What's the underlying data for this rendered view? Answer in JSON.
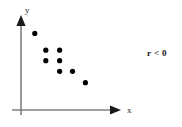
{
  "chart_data": {
    "type": "scatter",
    "title": "",
    "subtitle": "",
    "xlabel": "x",
    "ylabel": "y",
    "xlim": [
      0,
      10
    ],
    "ylim": [
      0,
      10
    ],
    "grid": false,
    "legend": null,
    "annotations": [
      {
        "name": "correlation-annotation",
        "text": "r < 0",
        "x": 9.3,
        "y": 8.0
      }
    ],
    "series": [
      {
        "name": "scatter-series",
        "marker": "filled-circle",
        "color": "#000000",
        "points": [
          {
            "x": 1.5,
            "y": 8.7
          },
          {
            "x": 2.7,
            "y": 6.8
          },
          {
            "x": 4.2,
            "y": 6.8
          },
          {
            "x": 2.7,
            "y": 5.6
          },
          {
            "x": 4.2,
            "y": 5.6
          },
          {
            "x": 4.2,
            "y": 4.4
          },
          {
            "x": 5.6,
            "y": 4.4
          },
          {
            "x": 7.0,
            "y": 3.1
          }
        ]
      }
    ]
  },
  "axes": {
    "y_axis_label": "y",
    "x_axis_label": "x",
    "axis_color": "#808080",
    "arrow_color": "#1a1a1a"
  },
  "marker_color": "#000000",
  "background_color": "#ffffff"
}
